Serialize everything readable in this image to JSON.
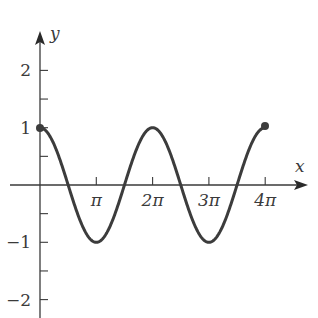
{
  "chart_data": {
    "type": "line",
    "title": "",
    "xlabel": "x",
    "ylabel": "y",
    "function": "y = cos(x)",
    "domain": [
      "0",
      "4π"
    ],
    "x_ticks": [
      {
        "label": "π",
        "value": 3.14159
      },
      {
        "label": "2π",
        "value": 6.28319
      },
      {
        "label": "3π",
        "value": 9.42478
      },
      {
        "label": "4π",
        "value": 12.56637
      }
    ],
    "y_ticks": [
      {
        "label": "2",
        "value": 2
      },
      {
        "label": "1",
        "value": 1
      },
      {
        "label": "−1",
        "value": -1
      },
      {
        "label": "−2",
        "value": -2
      }
    ],
    "y_minor_ticks": [
      1.5,
      0.5,
      -0.5,
      -1.5
    ],
    "ylim": [
      -2.3,
      2.7
    ],
    "xlim": [
      0,
      13.5
    ],
    "grid": false,
    "endpoints": [
      {
        "x": "0",
        "y": 1,
        "marker": "filled-dot"
      },
      {
        "x": "4π",
        "y": 1,
        "marker": "filled-dot"
      }
    ],
    "key_points": [
      {
        "x": "0",
        "y": 1
      },
      {
        "x": "π/2",
        "y": 0
      },
      {
        "x": "π",
        "y": -1
      },
      {
        "x": "3π/2",
        "y": 0
      },
      {
        "x": "2π",
        "y": 1
      },
      {
        "x": "5π/2",
        "y": 0
      },
      {
        "x": "3π",
        "y": -1
      },
      {
        "x": "7π/2",
        "y": 0
      },
      {
        "x": "4π",
        "y": 1
      }
    ]
  },
  "style": {
    "axis_color": "#3a3a3a",
    "curve_color": "#3c3c3c"
  }
}
